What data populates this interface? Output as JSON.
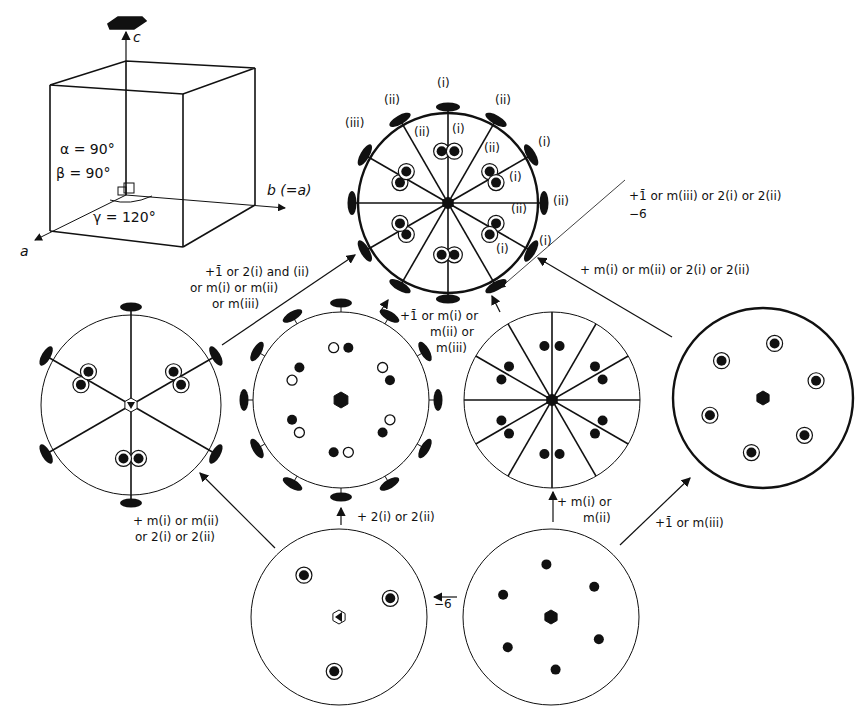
{
  "figure": {
    "unit_cell": {
      "axis_c": "c",
      "axis_b": "b (=a)",
      "axis_a": "a",
      "alpha": "α = 90°",
      "beta": "β = 90°",
      "gamma": "γ = 120°"
    },
    "top_circle_labels": {
      "i_top": "(i)",
      "ii_left": "(ii)",
      "ii_right": "(ii)",
      "iii": "(iii)",
      "ii_inner_left": "(ii)",
      "i_inner": "(i)",
      "ii_inner_right": "(ii)",
      "i_right_upper": "(i)",
      "i_inner_right": "(i)",
      "ii_right_mid": "(ii)",
      "ii_inner_mid": "(ii)",
      "i_inner_lower": "(i)",
      "i_right_lower": "(i)"
    },
    "annotations": {
      "top_right_line1": "+1̄ or m(iii) or 2(i) or 2(ii)",
      "top_right_line2": "−6̄",
      "right_mid": "+ m(i) or m(ii) or 2(i) or 2(ii)",
      "left_upper_line1": "+1̄ or 2(i) and (ii)",
      "left_upper_line2": "or m(i) or m(ii)",
      "left_upper_line3": "or m(iii)",
      "center_line1": "+1̄ or m(i) or",
      "center_line2": "m(ii) or",
      "center_line3": "m(iii)",
      "left_lower_line1": "+ m(i) or m(ii)",
      "left_lower_line2": "or 2(i) or 2(ii)",
      "bottom_mid": "+ 2(i) or 2(ii)",
      "bottom_arrow": "−6̄",
      "right_lower_line1": "+ m(i) or",
      "right_lower_line2": "m(ii)",
      "right_bottom": "+1̄ or m(iii)"
    }
  }
}
